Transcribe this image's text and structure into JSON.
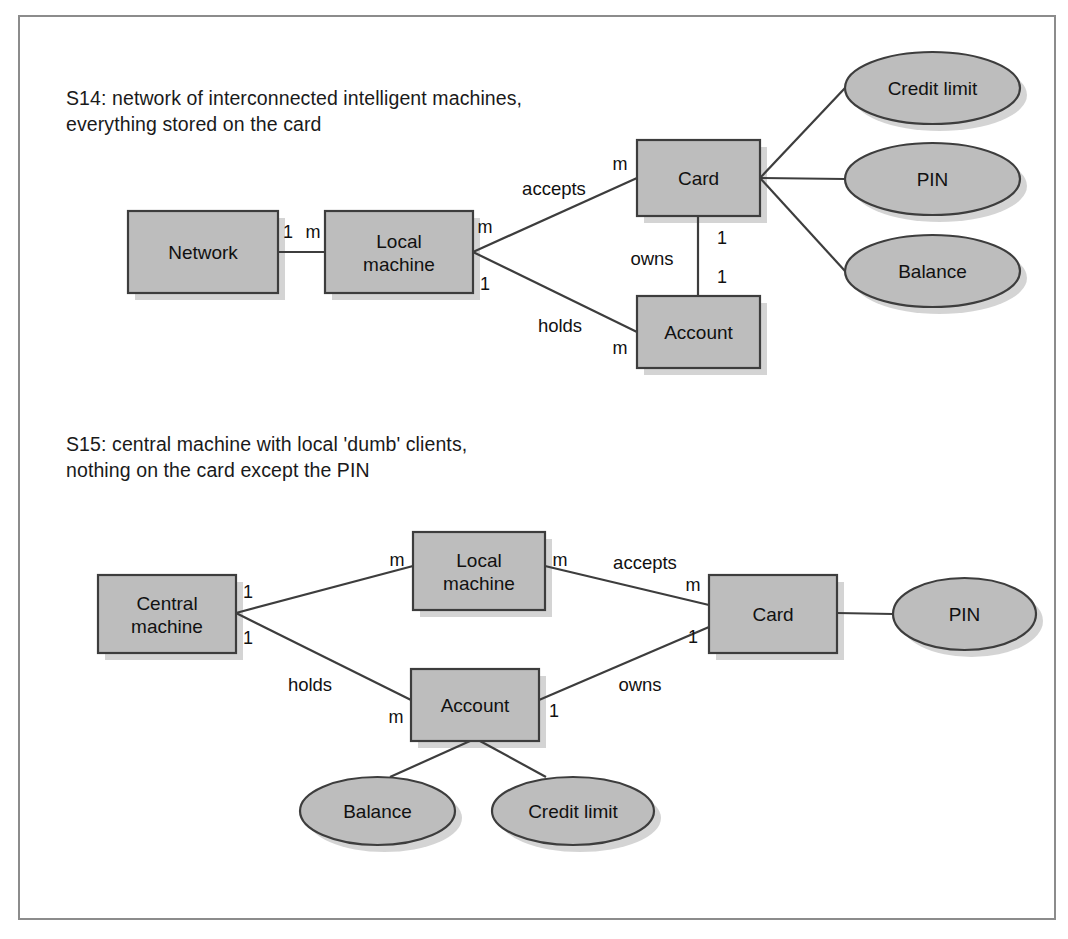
{
  "figure": {
    "background_color": "#ffffff",
    "frame_color": "#8c8c8c",
    "node_fill": "#bdbdbd",
    "node_stroke": "#3d3d3d",
    "text_color": "#111111"
  },
  "diagrams": [
    {
      "id": "s14",
      "caption": "S14: network of interconnected intelligent machines,\neverything stored on the card",
      "entities": [
        {
          "key": "network",
          "label": "Network",
          "shape": "rect",
          "x": 128,
          "y": 211,
          "w": 150,
          "h": 82
        },
        {
          "key": "local_machine",
          "label": "Local\nmachine",
          "shape": "rect",
          "x": 325,
          "y": 211,
          "w": 148,
          "h": 82
        },
        {
          "key": "card",
          "label": "Card",
          "shape": "rect",
          "x": 637,
          "y": 140,
          "w": 123,
          "h": 76
        },
        {
          "key": "account",
          "label": "Account",
          "shape": "rect",
          "x": 637,
          "y": 296,
          "w": 123,
          "h": 72
        },
        {
          "key": "credit_limit",
          "label": "Credit limit",
          "shape": "ellipse",
          "x": 845,
          "y": 52,
          "w": 175,
          "h": 72
        },
        {
          "key": "pin",
          "label": "PIN",
          "shape": "ellipse",
          "x": 845,
          "y": 143,
          "w": 175,
          "h": 72
        },
        {
          "key": "balance",
          "label": "Balance",
          "shape": "ellipse",
          "x": 845,
          "y": 235,
          "w": 175,
          "h": 72
        }
      ],
      "edges": [
        {
          "key": "network-local",
          "from": [
            278,
            252
          ],
          "to": [
            325,
            252
          ],
          "label": "",
          "label_pos": [
            302,
            232
          ]
        },
        {
          "key": "local-card",
          "from": [
            473,
            252
          ],
          "to": [
            637,
            178
          ],
          "label": "accepts",
          "label_pos": [
            554,
            188
          ]
        },
        {
          "key": "local-account",
          "from": [
            473,
            252
          ],
          "to": [
            637,
            332
          ],
          "label": "holds",
          "label_pos": [
            560,
            325
          ]
        },
        {
          "key": "card-account",
          "from": [
            698,
            216
          ],
          "to": [
            698,
            296
          ],
          "label": "owns",
          "label_pos": [
            652,
            258
          ]
        },
        {
          "key": "card-credit",
          "from": [
            760,
            178
          ],
          "to": [
            845,
            88
          ],
          "label": "",
          "label_pos": [
            800,
            130
          ]
        },
        {
          "key": "card-pin",
          "from": [
            760,
            178
          ],
          "to": [
            845,
            179
          ],
          "label": "",
          "label_pos": [
            800,
            168
          ]
        },
        {
          "key": "card-balance",
          "from": [
            760,
            178
          ],
          "to": [
            845,
            271
          ],
          "label": "",
          "label_pos": [
            800,
            228
          ]
        }
      ],
      "cardinalities": [
        {
          "key": "network-1",
          "value": "1",
          "x": 288,
          "y": 232
        },
        {
          "key": "local-m",
          "value": "m",
          "x": 313,
          "y": 232
        },
        {
          "key": "local-up-m",
          "value": "m",
          "x": 485,
          "y": 227
        },
        {
          "key": "local-dn-1",
          "value": "1",
          "x": 485,
          "y": 284
        },
        {
          "key": "card-m",
          "value": "m",
          "x": 620,
          "y": 164
        },
        {
          "key": "card-1",
          "value": "1",
          "x": 722,
          "y": 238
        },
        {
          "key": "acct-1",
          "value": "1",
          "x": 722,
          "y": 277
        },
        {
          "key": "acct-m",
          "value": "m",
          "x": 620,
          "y": 348
        }
      ]
    },
    {
      "id": "s15",
      "caption": "S15: central machine with local 'dumb' clients,\nnothing on the card except the PIN",
      "entities": [
        {
          "key": "central_machine",
          "label": "Central\nmachine",
          "shape": "rect",
          "x": 98,
          "y": 575,
          "w": 138,
          "h": 78
        },
        {
          "key": "local_machine",
          "label": "Local\nmachine",
          "shape": "rect",
          "x": 413,
          "y": 532,
          "w": 132,
          "h": 78
        },
        {
          "key": "account",
          "label": "Account",
          "shape": "rect",
          "x": 411,
          "y": 669,
          "w": 128,
          "h": 72
        },
        {
          "key": "card",
          "label": "Card",
          "shape": "rect",
          "x": 709,
          "y": 575,
          "w": 128,
          "h": 78
        },
        {
          "key": "pin",
          "label": "PIN",
          "shape": "ellipse",
          "x": 893,
          "y": 578,
          "w": 143,
          "h": 72
        },
        {
          "key": "balance",
          "label": "Balance",
          "shape": "ellipse",
          "x": 300,
          "y": 777,
          "w": 155,
          "h": 68
        },
        {
          "key": "credit_limit",
          "label": "Credit limit",
          "shape": "ellipse",
          "x": 492,
          "y": 777,
          "w": 162,
          "h": 68
        }
      ],
      "edges": [
        {
          "key": "central-local",
          "from": [
            236,
            613
          ],
          "to": [
            413,
            566
          ],
          "label": "",
          "label_pos": [
            320,
            572
          ]
        },
        {
          "key": "central-account",
          "from": [
            236,
            613
          ],
          "to": [
            411,
            700
          ],
          "label": "holds",
          "label_pos": [
            310,
            684
          ]
        },
        {
          "key": "local-card",
          "from": [
            545,
            566
          ],
          "to": [
            709,
            605
          ],
          "label": "accepts",
          "label_pos": [
            645,
            562
          ]
        },
        {
          "key": "account-card",
          "from": [
            539,
            700
          ],
          "to": [
            709,
            627
          ],
          "label": "owns",
          "label_pos": [
            640,
            684
          ]
        },
        {
          "key": "card-pin",
          "from": [
            837,
            613
          ],
          "to": [
            893,
            614
          ],
          "label": "",
          "label_pos": [
            865,
            604
          ]
        },
        {
          "key": "account-balance",
          "from": [
            470,
            741
          ],
          "to": [
            390,
            777
          ],
          "label": "",
          "label_pos": [
            420,
            762
          ]
        },
        {
          "key": "account-credit",
          "from": [
            480,
            741
          ],
          "to": [
            546,
            777
          ],
          "label": "",
          "label_pos": [
            520,
            762
          ]
        }
      ],
      "cardinalities": [
        {
          "key": "central-up-1",
          "value": "1",
          "x": 248,
          "y": 592
        },
        {
          "key": "central-dn-1",
          "value": "1",
          "x": 248,
          "y": 638
        },
        {
          "key": "local-left-m",
          "value": "m",
          "x": 397,
          "y": 560
        },
        {
          "key": "local-rt-m",
          "value": "m",
          "x": 560,
          "y": 560
        },
        {
          "key": "card-m",
          "value": "m",
          "x": 693,
          "y": 585
        },
        {
          "key": "card-1",
          "value": "1",
          "x": 693,
          "y": 637
        },
        {
          "key": "acct-m",
          "value": "m",
          "x": 396,
          "y": 717
        },
        {
          "key": "acct-1",
          "value": "1",
          "x": 554,
          "y": 711
        }
      ]
    }
  ]
}
